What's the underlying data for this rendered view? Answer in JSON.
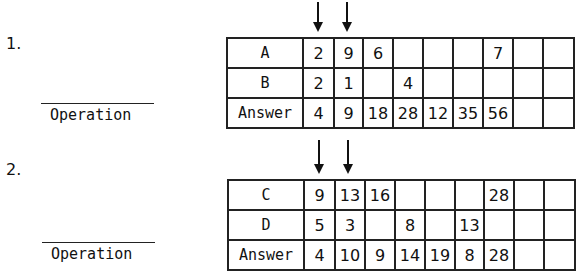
{
  "problems": [
    {
      "number": "1.",
      "operation_label": "Operation",
      "rows": [
        {
          "label": "A",
          "cells": [
            "2",
            "9",
            "6",
            "",
            "",
            "",
            "7",
            "",
            ""
          ]
        },
        {
          "label": "B",
          "cells": [
            "2",
            "1",
            "",
            "4",
            "",
            "",
            "",
            "",
            ""
          ]
        },
        {
          "label": "Answer",
          "cells": [
            "4",
            "9",
            "18",
            "28",
            "12",
            "35",
            "56",
            "",
            ""
          ]
        }
      ],
      "arrows_on_columns": [
        1,
        2
      ]
    },
    {
      "number": "2.",
      "operation_label": "Operation",
      "rows": [
        {
          "label": "C",
          "cells": [
            "9",
            "13",
            "16",
            "",
            "",
            "",
            "28",
            "",
            ""
          ]
        },
        {
          "label": "D",
          "cells": [
            "5",
            "3",
            "",
            "8",
            "",
            "13",
            "",
            "",
            ""
          ]
        },
        {
          "label": "Answer",
          "cells": [
            "4",
            "10",
            "9",
            "14",
            "19",
            "8",
            "28",
            "",
            ""
          ]
        }
      ],
      "arrows_on_columns": [
        1,
        2
      ]
    }
  ],
  "icons": {
    "arrow": "down-arrow-icon"
  }
}
